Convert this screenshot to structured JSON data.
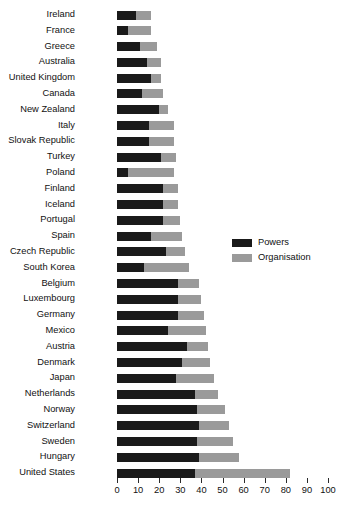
{
  "chart_data": {
    "type": "bar",
    "orientation": "horizontal",
    "stacked": true,
    "title": "",
    "xlabel": "",
    "ylabel": "",
    "xlim": [
      0,
      100
    ],
    "xticks": [
      0,
      10,
      20,
      30,
      40,
      50,
      60,
      70,
      80,
      90,
      100
    ],
    "grid": false,
    "legend_position": "center-right",
    "colors": {
      "powers": "#1a1a1a",
      "organisation": "#9a9a9a",
      "text": "#111111"
    },
    "categories": [
      "Ireland",
      "France",
      "Greece",
      "Australia",
      "United Kingdom",
      "Canada",
      "New Zealand",
      "Italy",
      "Slovak Republic",
      "Turkey",
      "Poland",
      "Finland",
      "Iceland",
      "Portugal",
      "Spain",
      "Czech Republic",
      "South Korea",
      "Belgium",
      "Luxembourg",
      "Germany",
      "Mexico",
      "Austria",
      "Denmark",
      "Japan",
      "Netherlands",
      "Norway",
      "Switzerland",
      "Sweden",
      "Hungary",
      "United States"
    ],
    "series": [
      {
        "name": "Powers",
        "color": "#1a1a1a",
        "values": [
          9,
          5,
          11,
          14,
          16,
          12,
          20,
          15,
          15,
          21,
          5,
          22,
          22,
          22,
          16,
          23,
          13,
          29,
          29,
          29,
          24,
          33,
          31,
          28,
          37,
          38,
          39,
          38,
          39,
          37
        ]
      },
      {
        "name": "Organisation",
        "color": "#9a9a9a",
        "values": [
          7,
          11,
          8,
          7,
          5,
          10,
          4,
          12,
          12,
          7,
          22,
          7,
          7,
          8,
          15,
          9,
          21,
          10,
          11,
          12,
          18,
          10,
          13,
          18,
          11,
          13,
          14,
          17,
          19,
          45
        ]
      }
    ],
    "totals": [
      16,
      16,
      19,
      21,
      21,
      22,
      24,
      27,
      27,
      28,
      27,
      29,
      29,
      30,
      31,
      32,
      34,
      39,
      40,
      41,
      42,
      43,
      44,
      46,
      48,
      51,
      53,
      55,
      58,
      82
    ]
  },
  "legend": {
    "items": [
      {
        "label": "Powers",
        "color": "#1a1a1a"
      },
      {
        "label": "Organisation",
        "color": "#9a9a9a"
      }
    ]
  },
  "caption": {
    "text": ""
  }
}
